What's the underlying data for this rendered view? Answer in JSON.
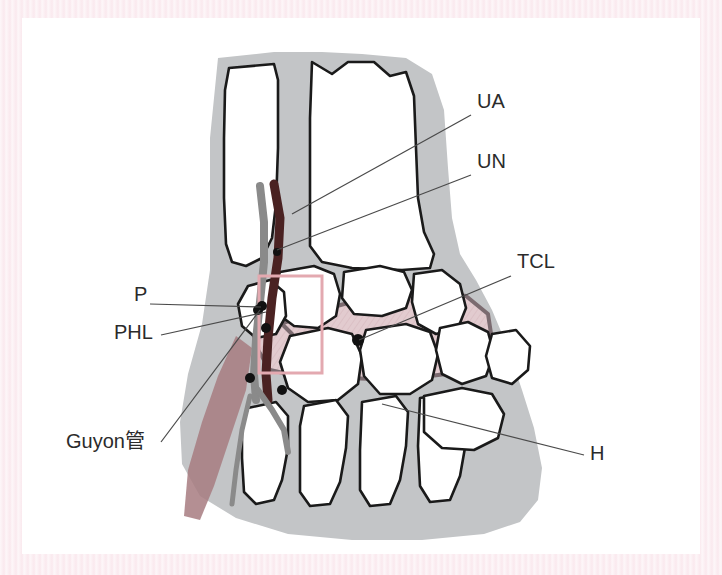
{
  "figure": {
    "background_color": "#ffffff",
    "scan_border_color": "#fbeef2",
    "soft_tissue_color": "#c3c5c7",
    "bone_fill_color": "#ffffff",
    "bone_outline_color": "#1a1a1a",
    "ligament_fill_color": "#e0c9cd",
    "ligament_outline_color": "#7b6b70",
    "artery_color": "#4a2222",
    "nerve_color": "#8a8a8a",
    "muscle_color": "#a77b80",
    "roi_box_color": "#e3a9b0",
    "leader_line_color": "#4a4a4a",
    "marker_dot_color": "#111111"
  },
  "labels": [
    {
      "id": "ua",
      "text": "UA",
      "meaning": "ulnar-artery",
      "x": 455,
      "y": 85,
      "leader": {
        "x1": 449,
        "y1": 97,
        "x2": 270,
        "y2": 196
      }
    },
    {
      "id": "un",
      "text": "UN",
      "meaning": "ulnar-nerve",
      "x": 455,
      "y": 145,
      "leader": {
        "x1": 449,
        "y1": 157,
        "x2": 255,
        "y2": 232
      }
    },
    {
      "id": "tcl",
      "text": "TCL",
      "meaning": "transverse-carpal-ligament",
      "x": 495,
      "y": 245,
      "leader": {
        "x1": 489,
        "y1": 258,
        "x2": 337,
        "y2": 322
      }
    },
    {
      "id": "p",
      "text": "P",
      "meaning": "pisiform",
      "x": 112,
      "y": 278,
      "leader": {
        "x1": 128,
        "y1": 286,
        "x2": 239,
        "y2": 289
      }
    },
    {
      "id": "phl",
      "text": "PHL",
      "meaning": "pisohamate-ligament",
      "x": 92,
      "y": 316,
      "leader": {
        "x1": 139,
        "y1": 317,
        "x2": 244,
        "y2": 294
      }
    },
    {
      "id": "guyon",
      "text": "Guyon管",
      "meaning": "guyon-canal",
      "x": 44,
      "y": 425,
      "leader": {
        "x1": 139,
        "y1": 424,
        "x2": 238,
        "y2": 292
      }
    },
    {
      "id": "h",
      "text": "H",
      "meaning": "hamate",
      "x": 568,
      "y": 437,
      "leader": {
        "x1": 562,
        "y1": 437,
        "x2": 360,
        "y2": 386
      }
    }
  ],
  "anatomy": {
    "soft_tissue_outline": "M 196 40 L 252 34 L 300 34 L 340 36 L 384 40 L 410 56 L 422 92 L 426 150 L 430 200 L 438 236 L 454 262 L 470 292 L 486 330 L 500 372 L 512 410 L 520 450 L 516 482 L 498 504 L 462 516 L 400 522 L 330 522 L 266 516 L 214 500 L 178 478 L 160 446 L 158 404 L 166 356 L 180 306 L 188 252 L 188 190 L 188 120 Z",
    "bones": [
      {
        "name": "ulna",
        "path": "M 207 50 L 252 46 L 256 62 L 256 130 L 254 186 L 250 220 L 240 240 L 224 248 L 210 244 L 204 226 L 202 180 L 202 120 L 203 72 Z"
      },
      {
        "name": "radius",
        "path": "M 290 44 L 310 56 L 326 44 L 352 44 L 368 58 L 384 54 L 392 78 L 394 130 L 396 180 L 402 214 L 412 236 L 408 250 L 380 252 L 330 250 L 300 244 L 288 228 L 288 170 L 288 100 Z"
      },
      {
        "name": "triquetrum",
        "path": "M 258 254 L 292 248 L 312 256 L 318 276 L 314 298 L 296 310 L 272 308 L 256 296 L 250 274 Z"
      },
      {
        "name": "lunate",
        "path": "M 322 254 L 358 248 L 382 254 L 390 272 L 384 290 L 360 298 L 332 296 L 320 280 Z"
      },
      {
        "name": "scaphoid",
        "path": "M 392 256 L 420 252 L 438 266 L 444 290 L 436 310 L 414 316 L 396 306 L 390 284 Z"
      },
      {
        "name": "pisiform",
        "path": "M 226 268 L 248 262 L 262 274 L 264 298 L 254 316 L 234 320 L 220 308 L 216 286 Z"
      },
      {
        "name": "hamate",
        "path": "M 268 318 L 306 310 L 330 316 L 340 338 L 336 366 L 316 382 L 286 384 L 266 370 L 258 344 Z"
      },
      {
        "name": "capitate",
        "path": "M 344 312 L 384 306 L 408 314 L 416 336 L 410 362 L 388 376 L 358 376 L 342 358 L 338 332 Z"
      },
      {
        "name": "trapezoid",
        "path": "M 418 310 L 446 304 L 466 314 L 472 336 L 464 358 L 440 366 L 420 356 L 414 332 Z"
      },
      {
        "name": "trapezium",
        "path": "M 470 316 L 494 312 L 508 328 L 506 352 L 490 366 L 470 360 L 464 338 Z"
      },
      {
        "name": "metacarpal-5",
        "path": "M 226 390 L 254 384 L 266 398 L 266 430 L 260 462 L 252 482 L 234 486 L 222 474 L 220 440 L 220 410 Z"
      },
      {
        "name": "metacarpal-4",
        "path": "M 282 388 L 314 382 L 326 398 L 324 430 L 318 464 L 308 486 L 288 488 L 278 474 L 278 436 L 278 408 Z"
      },
      {
        "name": "metacarpal-3",
        "path": "M 340 384 L 374 378 L 386 394 L 384 428 L 378 462 L 368 486 L 348 488 L 338 472 L 338 432 Z"
      },
      {
        "name": "metacarpal-2",
        "path": "M 398 380 L 432 374 L 446 390 L 444 424 L 438 458 L 428 482 L 408 484 L 398 468 L 396 428 Z"
      },
      {
        "name": "distal-carpal-row-extra",
        "path": "M 402 378 L 440 370 L 470 376 L 482 396 L 476 420 L 452 432 L 420 430 L 402 414 Z"
      }
    ],
    "ligaments": [
      {
        "name": "transverse-carpal-ligament-band",
        "path": "M 258 306 L 300 292 L 352 278 L 404 272 L 444 278 L 466 296 L 470 322 L 456 344 L 424 356 L 376 362 L 326 360 L 286 350 L 262 332 Z"
      },
      {
        "name": "pisohamate-ligament-band",
        "path": "M 232 296 L 254 300 L 270 316 L 276 340 L 266 356 L 248 352 L 236 332 L 230 312 Z"
      }
    ],
    "vessels": [
      {
        "name": "ulnar-artery",
        "kind": "artery",
        "path": "M 252 166 L 258 200 L 256 240 L 250 280 L 246 320 L 244 356 L 246 382",
        "width": 9
      },
      {
        "name": "ulnar-nerve",
        "kind": "nerve",
        "path": "M 238 168 L 242 204 L 242 244 L 238 284 L 234 322 L 232 356 L 234 382",
        "width": 8
      },
      {
        "name": "deep-palmar-branch",
        "kind": "nerve",
        "path": "M 236 372 L 250 392 L 262 412 L 266 434",
        "width": 6
      },
      {
        "name": "superficial-branch",
        "kind": "nerve",
        "path": "M 228 378 L 220 412 L 214 452 L 210 486",
        "width": 5
      }
    ],
    "muscles": [
      {
        "name": "hypothenar-muscle",
        "path": "M 214 318 L 230 330 L 224 372 L 208 420 L 192 468 L 178 502 L 162 498 L 166 452 L 180 404 L 196 358 Z"
      }
    ],
    "roi_box": {
      "x": 237,
      "y": 258,
      "width": 63,
      "height": 97
    },
    "marker_dots": [
      {
        "name": "pisiform-marker",
        "x": 240,
        "y": 288,
        "r": 5
      },
      {
        "name": "pisohamate-marker",
        "x": 244,
        "y": 310,
        "r": 5
      },
      {
        "name": "transverse-carpal-ligament-marker",
        "x": 336,
        "y": 322,
        "r": 6
      },
      {
        "name": "ulnar-artery-marker",
        "x": 255,
        "y": 234,
        "r": 4
      },
      {
        "name": "guyon-canal-marker",
        "x": 236,
        "y": 292,
        "r": 5
      },
      {
        "name": "deep-branch-marker",
        "x": 260,
        "y": 372,
        "r": 5
      },
      {
        "name": "hook-of-hamate-marker",
        "x": 228,
        "y": 360,
        "r": 5
      }
    ]
  }
}
